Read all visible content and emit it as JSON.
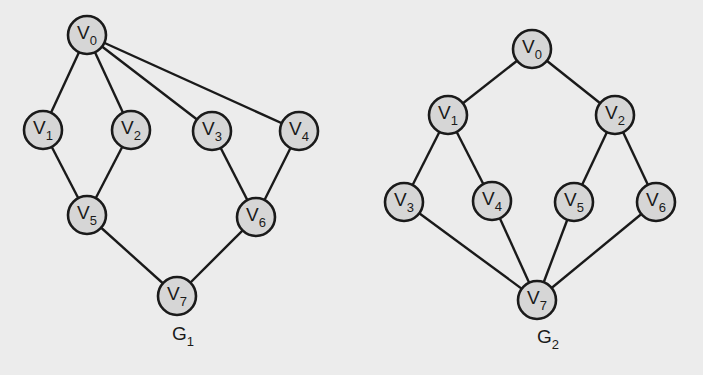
{
  "graphs": [
    {
      "id": "G1",
      "label": "G",
      "label_sub": "1",
      "label_pos": [
        172,
        340
      ],
      "nodes": [
        {
          "id": "V0",
          "letter": "V",
          "sub": "0",
          "x": 87,
          "y": 35
        },
        {
          "id": "V1",
          "letter": "V",
          "sub": "1",
          "x": 43,
          "y": 130
        },
        {
          "id": "V2",
          "letter": "V",
          "sub": "2",
          "x": 131,
          "y": 130
        },
        {
          "id": "V3",
          "letter": "V",
          "sub": "3",
          "x": 212,
          "y": 131
        },
        {
          "id": "V4",
          "letter": "V",
          "sub": "4",
          "x": 299,
          "y": 131
        },
        {
          "id": "V5",
          "letter": "V",
          "sub": "5",
          "x": 87,
          "y": 215
        },
        {
          "id": "V6",
          "letter": "V",
          "sub": "6",
          "x": 256,
          "y": 217
        },
        {
          "id": "V7",
          "letter": "V",
          "sub": "7",
          "x": 177,
          "y": 296
        }
      ],
      "edges": [
        [
          "V0",
          "V1"
        ],
        [
          "V0",
          "V2"
        ],
        [
          "V0",
          "V3"
        ],
        [
          "V0",
          "V4"
        ],
        [
          "V1",
          "V5"
        ],
        [
          "V2",
          "V5"
        ],
        [
          "V3",
          "V6"
        ],
        [
          "V4",
          "V6"
        ],
        [
          "V5",
          "V7"
        ],
        [
          "V6",
          "V7"
        ]
      ]
    },
    {
      "id": "G2",
      "label": "G",
      "label_sub": "2",
      "label_pos": [
        537,
        343
      ],
      "nodes": [
        {
          "id": "V0",
          "letter": "V",
          "sub": "0",
          "x": 532,
          "y": 49
        },
        {
          "id": "V1",
          "letter": "V",
          "sub": "1",
          "x": 448,
          "y": 115
        },
        {
          "id": "V2",
          "letter": "V",
          "sub": "2",
          "x": 615,
          "y": 115
        },
        {
          "id": "V3",
          "letter": "V",
          "sub": "3",
          "x": 404,
          "y": 202
        },
        {
          "id": "V4",
          "letter": "V",
          "sub": "4",
          "x": 492,
          "y": 201
        },
        {
          "id": "V5",
          "letter": "V",
          "sub": "5",
          "x": 574,
          "y": 202
        },
        {
          "id": "V6",
          "letter": "V",
          "sub": "6",
          "x": 656,
          "y": 202
        },
        {
          "id": "V7",
          "letter": "V",
          "sub": "7",
          "x": 537,
          "y": 300
        }
      ],
      "edges": [
        [
          "V0",
          "V1"
        ],
        [
          "V0",
          "V2"
        ],
        [
          "V1",
          "V3"
        ],
        [
          "V1",
          "V4"
        ],
        [
          "V2",
          "V5"
        ],
        [
          "V2",
          "V6"
        ],
        [
          "V3",
          "V7"
        ],
        [
          "V4",
          "V7"
        ],
        [
          "V5",
          "V7"
        ],
        [
          "V6",
          "V7"
        ]
      ]
    }
  ],
  "style": {
    "node_radius": 19,
    "node_fill": "#d6d6d6",
    "stroke": "#1a1a1a",
    "background": "#ececec"
  }
}
